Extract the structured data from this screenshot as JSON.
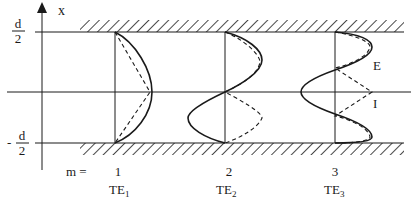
{
  "axis": {
    "label": "x"
  },
  "walls": {
    "top_label_num": "d",
    "top_label_den": "2",
    "bottom_label_sign": "-",
    "bottom_label_num": "d",
    "bottom_label_den": "2"
  },
  "mode_prefix": "m =",
  "modes": [
    {
      "m": "1",
      "name": "TE",
      "sub": "1"
    },
    {
      "m": "2",
      "name": "TE",
      "sub": "2"
    },
    {
      "m": "3",
      "name": "TE",
      "sub": "3"
    }
  ],
  "legend": {
    "E": "E",
    "I": "I"
  },
  "colors": {
    "line": "#1a1a1a",
    "background": "#ffffff"
  }
}
